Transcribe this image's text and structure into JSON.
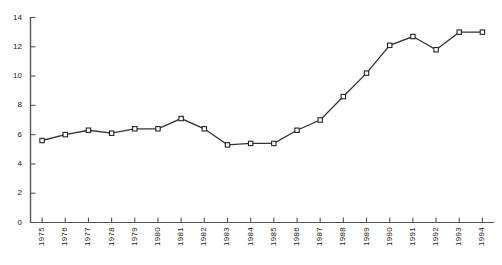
{
  "chart_data": {
    "type": "line",
    "title": "",
    "subtitle": "",
    "xlabel": "",
    "ylabel": "",
    "categories": [
      "1975",
      "1976",
      "1977",
      "1978",
      "1979",
      "1980",
      "1981",
      "1982",
      "1983",
      "1984",
      "1985",
      "1986",
      "1987",
      "1988",
      "1989",
      "1990",
      "1991",
      "1992",
      "1993",
      "1994"
    ],
    "values": [
      5.6,
      6.0,
      6.3,
      6.1,
      6.4,
      6.4,
      7.1,
      6.4,
      5.3,
      5.4,
      5.4,
      6.3,
      7.0,
      8.6,
      10.2,
      12.1,
      12.7,
      11.8,
      13.0,
      13.0
    ],
    "series": [
      {
        "name": "series-1",
        "values": [
          5.6,
          6.0,
          6.3,
          6.1,
          6.4,
          6.4,
          7.1,
          6.4,
          5.3,
          5.4,
          5.4,
          6.3,
          7.0,
          8.6,
          10.2,
          12.1,
          12.7,
          11.8,
          13.0,
          13.0
        ]
      }
    ],
    "ylim": [
      0,
      14
    ],
    "yticks": [
      0,
      2,
      4,
      6,
      8,
      10,
      12,
      14
    ],
    "ytick_labels": [
      "0",
      "2",
      "4",
      "6",
      "8",
      "10",
      "12",
      "14"
    ],
    "xtick_labels": [
      "1975",
      "1976",
      "1977",
      "1978",
      "1979",
      "1980",
      "1981",
      "1982",
      "1983",
      "1984",
      "1985",
      "1986",
      "1987",
      "1988",
      "1989",
      "1990",
      "1991",
      "1992",
      "1993",
      "1994"
    ],
    "grid": false,
    "legend": null,
    "marker": "open-square",
    "line_color": "#333333",
    "axis_color": "#555555",
    "marker_fill": "#ffffff",
    "marker_edge": "#222222"
  }
}
